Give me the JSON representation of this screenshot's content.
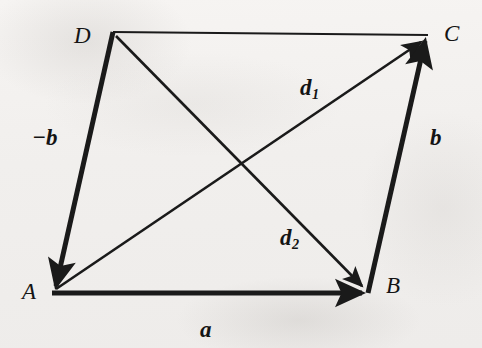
{
  "figure": {
    "kind": "vector-parallelogram-diagram",
    "background_color": "#f3f1ef",
    "ink_color": "#1a1a1a",
    "width": 482,
    "height": 348
  },
  "vertices": [
    {
      "id": "A",
      "label": "A",
      "x": 52,
      "y": 293
    },
    {
      "id": "B",
      "label": "B",
      "x": 368,
      "y": 293
    },
    {
      "id": "C",
      "label": "C",
      "x": 428,
      "y": 35
    },
    {
      "id": "D",
      "label": "D",
      "x": 113,
      "y": 32
    }
  ],
  "vectors": [
    {
      "id": "a",
      "label": "a",
      "subscript": "",
      "from": "A",
      "to": "B",
      "stroke_width": 5,
      "arrowhead": "end",
      "style": "thick"
    },
    {
      "id": "b",
      "label": "b",
      "subscript": "",
      "from": "B",
      "to": "C",
      "stroke_width": 5,
      "arrowhead": "end",
      "style": "thick"
    },
    {
      "id": "neg-b",
      "label": "−b",
      "subscript": "",
      "from": "D",
      "to": "A",
      "stroke_width": 5,
      "arrowhead": "end",
      "style": "thick"
    },
    {
      "id": "d1",
      "label": "d",
      "subscript": "1",
      "from": "A",
      "to": "C",
      "stroke_width": 2.6,
      "arrowhead": "end",
      "style": "thin-diagonal"
    },
    {
      "id": "d2",
      "label": "d",
      "subscript": "2",
      "from": "D",
      "to": "B",
      "stroke_width": 2.6,
      "arrowhead": "end",
      "style": "thin-diagonal"
    }
  ],
  "plain_edges": [
    {
      "id": "DC",
      "from": "D",
      "to": "C",
      "stroke_width": 2.2,
      "arrowhead": "none"
    }
  ],
  "intersection": {
    "x": 242,
    "y": 162
  },
  "labels": {
    "vertex_A": "A",
    "vertex_B": "B",
    "vertex_C": "C",
    "vertex_D": "D",
    "vector_a": "a",
    "vector_b": "b",
    "vector_neg_b": "−b",
    "vector_d1_base": "d",
    "vector_d1_sub": "1",
    "vector_d2_base": "d",
    "vector_d2_sub": "2"
  }
}
